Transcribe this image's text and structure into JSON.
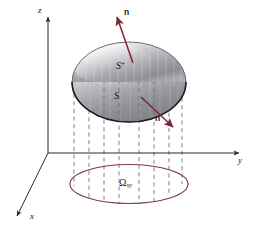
{
  "figure": {
    "background_color": "#ffffff"
  },
  "axes": {
    "z_label": "z",
    "y_label": "y",
    "x_label": "x",
    "color": "#2b2a2e",
    "origin": {
      "x": 48,
      "y": 153
    }
  },
  "surface": {
    "upper_label": "S",
    "upper_label_superscript": "+",
    "lower_label": "S",
    "fill_top": "#f4f4f5",
    "fill_mid": "#9d9da2",
    "fill_bottom": "#7f7f85",
    "edge_color": "#1c1b20"
  },
  "normals": [
    {
      "name": "upper-normal",
      "label": "n",
      "color": "#7a2631"
    },
    {
      "name": "lower-normal",
      "label": "n",
      "color": "#7a2631"
    }
  ],
  "region": {
    "label": "Ω",
    "subscript": "xy",
    "outline_color": "#7d3b49"
  },
  "projection_lines": {
    "color": "#6d6d72",
    "style": "dashed",
    "count": 8
  }
}
